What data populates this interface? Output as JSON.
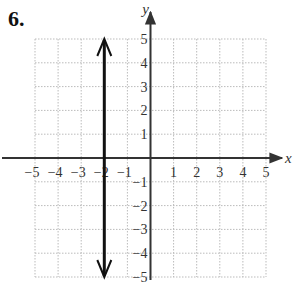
{
  "problem": {
    "number": "6."
  },
  "chart_data": {
    "type": "line",
    "title": "",
    "xlabel": "x",
    "ylabel": "y",
    "xlim": [
      -5,
      5
    ],
    "ylim": [
      -5,
      5
    ],
    "grid": true,
    "grid_style": "dotted",
    "x_ticks": [
      -5,
      -4,
      -3,
      -2,
      -1,
      1,
      2,
      3,
      4,
      5
    ],
    "y_ticks": [
      5,
      4,
      3,
      2,
      1,
      -1,
      -2,
      -3,
      -4,
      -5
    ],
    "x_tick_labels": [
      "−5",
      "−4",
      "−3",
      "−2",
      "−1",
      "1",
      "2",
      "3",
      "4",
      "5"
    ],
    "y_tick_labels": [
      "5",
      "4",
      "3",
      "2",
      "1",
      "−1",
      "−2",
      "−3",
      "−4",
      "−5"
    ],
    "series": [
      {
        "name": "x = -2",
        "kind": "vertical line with arrows at both ends",
        "x": [
          -2,
          -2
        ],
        "y": [
          -5,
          5
        ]
      }
    ],
    "colors": {
      "grid": "#bbbbbb",
      "axes": "#333333",
      "line": "#111111"
    }
  }
}
